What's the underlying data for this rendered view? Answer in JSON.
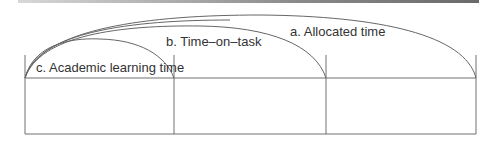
{
  "diagram": {
    "title": "",
    "labels": {
      "allocated": "a. Allocated time",
      "time_on_task": "b. Time–on–task",
      "academic": "c. Academic learning time"
    },
    "segments": 3,
    "line_color": "#6e6e6e"
  }
}
